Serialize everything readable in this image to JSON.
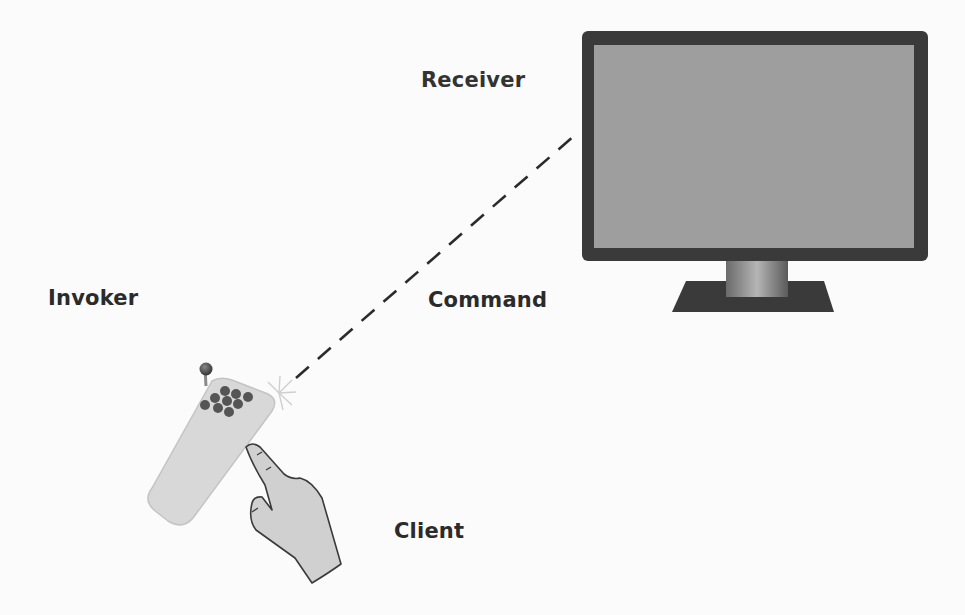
{
  "diagram": {
    "labels": {
      "receiver": "Receiver",
      "invoker": "Invoker",
      "command": "Command",
      "client": "Client"
    },
    "elements": [
      {
        "role": "receiver",
        "depicts": "tv-monitor-icon"
      },
      {
        "role": "invoker",
        "depicts": "remote-control-icon"
      },
      {
        "role": "command",
        "depicts": "dashed-signal-line"
      },
      {
        "role": "client",
        "depicts": "pointing-hand-icon"
      }
    ],
    "colors": {
      "background": "#fbfbfb",
      "label_text": "#2b2b2b",
      "monitor_bezel": "#3a3a3a",
      "monitor_screen": "#9e9e9e",
      "remote_body": "#d8d8d8",
      "remote_buttons": "#555555",
      "hand_fill": "#d0d0d0",
      "signal_line": "#2b2b2b"
    }
  }
}
